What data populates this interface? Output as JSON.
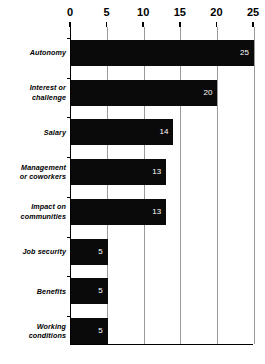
{
  "chart_data": {
    "type": "bar",
    "orientation": "horizontal",
    "title": "",
    "subtitle": "",
    "xlabel": "",
    "ylabel": "",
    "xlim": [
      0,
      25
    ],
    "xticks": [
      0,
      5,
      10,
      15,
      20,
      25
    ],
    "grid": true,
    "legend": false,
    "categories": [
      "Autonomy",
      "Interest or challenge",
      "Salary",
      "Management or coworkers",
      "Impact on communities",
      "Job security",
      "Benefits",
      "Working conditions"
    ],
    "category_lines": [
      [
        "Autonomy"
      ],
      [
        "Interest or",
        "challenge"
      ],
      [
        "Salary"
      ],
      [
        "Management",
        "or  coworkers"
      ],
      [
        "Impact on",
        "communities"
      ],
      [
        "Job security"
      ],
      [
        "Benefits"
      ],
      [
        "Working",
        "conditions"
      ]
    ],
    "values": [
      25,
      20,
      14,
      13,
      13,
      5,
      5,
      5
    ],
    "value_labels": [
      "25",
      "20",
      "14",
      "13",
      "13",
      "5",
      "5",
      "5"
    ],
    "bar_color": "#0a0a0a",
    "value_label_color": "#ffffff",
    "axis_color": "#000000",
    "grid_color": "#9a9a9a",
    "background_color": "#ffffff"
  }
}
